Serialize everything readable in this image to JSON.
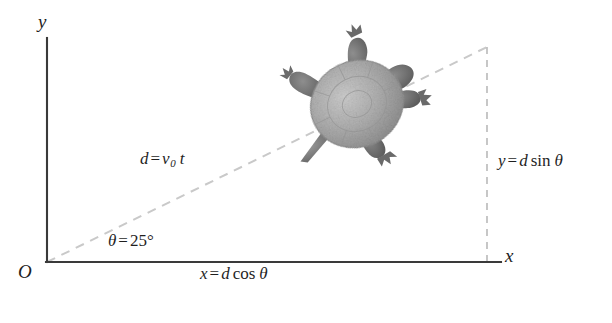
{
  "figure": {
    "background_color": "#ffffff",
    "axis_color": "#3a3a3a",
    "dashed_color": "#c9c9c9",
    "text_color": "#1f1f1f",
    "labels": {
      "y_axis": "y",
      "x_axis": "x",
      "origin": "O",
      "distance": {
        "lhs": "d",
        "op": "=",
        "rhs_var": "v",
        "rhs_sub": "0",
        "rhs_t": "t",
        "full": "d = v0 t"
      },
      "angle": {
        "symbol": "θ",
        "op": "=",
        "value": "25",
        "unit": "°",
        "full": "θ = 25°"
      },
      "x_component": {
        "lhs": "x",
        "op": "=",
        "d": "d",
        "fn": "cos",
        "theta": "θ",
        "full": "x = d cos θ"
      },
      "y_component": {
        "lhs": "y",
        "op": "=",
        "d": "d",
        "fn": "sin",
        "theta": "θ",
        "full": "y = d sin θ"
      }
    },
    "geometry": {
      "origin_px": [
        47,
        262
      ],
      "y_axis_top_px": [
        47,
        38
      ],
      "x_axis_right_px": [
        501,
        262
      ],
      "vector_tip_px": [
        487,
        47
      ],
      "angle_degrees": 25
    },
    "turtle": {
      "name": "turtle-illustration",
      "center_px": [
        357,
        104
      ],
      "shell_color": "#a9a9a9",
      "limb_color": "#6e6e6e"
    }
  }
}
